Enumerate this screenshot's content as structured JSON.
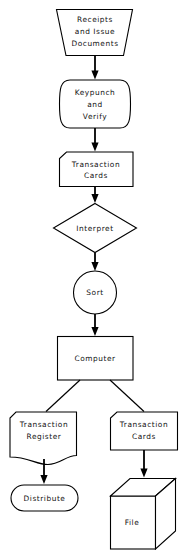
{
  "diagram": {
    "background_color": "#ffffff",
    "line_color": "#000000",
    "text_color": "#111111",
    "nodes": [
      {
        "id": "receipts",
        "shape": "trapezoid-inverted",
        "label_lines": [
          "Receipts",
          "and Issue",
          "Documents"
        ],
        "line1": "Receipts",
        "line2": "and Issue",
        "line3": "Documents"
      },
      {
        "id": "keypunch",
        "shape": "manual-operation-curved",
        "label_lines": [
          "Keypunch",
          "and",
          "Verify"
        ],
        "line1": "Keypunch",
        "line2": "and",
        "line3": "Verify"
      },
      {
        "id": "transaction-cards-1",
        "shape": "punched-card",
        "label_lines": [
          "Transaction",
          "Cards"
        ],
        "line1": "Transaction",
        "line2": "Cards"
      },
      {
        "id": "interpret",
        "shape": "diamond",
        "label_lines": [
          "Interpret"
        ],
        "line1": "Interpret"
      },
      {
        "id": "sort",
        "shape": "circle",
        "label_lines": [
          "Sort"
        ],
        "line1": "Sort"
      },
      {
        "id": "computer",
        "shape": "rectangle",
        "label_lines": [
          "Computer"
        ],
        "line1": "Computer"
      },
      {
        "id": "transaction-register",
        "shape": "document",
        "label_lines": [
          "Transaction",
          "Register"
        ],
        "line1": "Transaction",
        "line2": "Register"
      },
      {
        "id": "transaction-cards-2",
        "shape": "punched-card",
        "label_lines": [
          "Transaction",
          "Cards"
        ],
        "line1": "Transaction",
        "line2": "Cards"
      },
      {
        "id": "distribute",
        "shape": "terminator-stadium",
        "label_lines": [
          "Distribute"
        ],
        "line1": "Distribute"
      },
      {
        "id": "file",
        "shape": "cube-3d",
        "label_lines": [
          "File"
        ],
        "line1": "File"
      }
    ],
    "edges": [
      {
        "id": "e1",
        "from": "receipts",
        "to": "keypunch",
        "type": "arrow-down"
      },
      {
        "id": "e2",
        "from": "keypunch",
        "to": "transaction-cards-1",
        "type": "arrow-down"
      },
      {
        "id": "e3",
        "from": "transaction-cards-1",
        "to": "interpret",
        "type": "arrow-down"
      },
      {
        "id": "e4",
        "from": "interpret",
        "to": "sort",
        "type": "arrow-down"
      },
      {
        "id": "e5",
        "from": "sort",
        "to": "computer",
        "type": "arrow-down"
      },
      {
        "id": "e6",
        "from": "computer",
        "to": "transaction-register",
        "type": "diagonal-left"
      },
      {
        "id": "e7",
        "from": "computer",
        "to": "transaction-cards-2",
        "type": "diagonal-right"
      },
      {
        "id": "e8",
        "from": "transaction-register",
        "to": "distribute",
        "type": "arrow-down"
      },
      {
        "id": "e9",
        "from": "transaction-cards-2",
        "to": "file",
        "type": "arrow-down"
      }
    ]
  }
}
